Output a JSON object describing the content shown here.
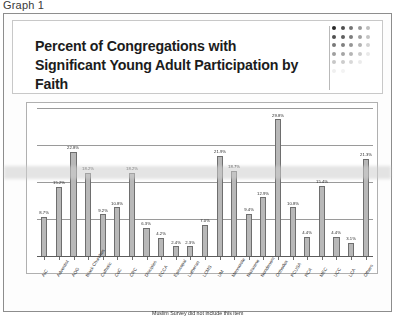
{
  "caption": "Graph 1",
  "title": "Percent of Congregations with Significant Young Adult Participation by Faith",
  "footnote": "Muslim Survey did not include this item",
  "colors": {
    "bar_fill": "#b8b8b8",
    "bar_stroke": "#6e6e6e",
    "grid": "#9a9a9a",
    "frame": "#8d8d8d",
    "text": "#1c1c1c"
  },
  "logo": {
    "name": "gradient-dot-grid-logo",
    "rows": 7,
    "cols": 5
  },
  "chart_data": {
    "type": "bar",
    "title": "Percent of Congregations with Significant Young Adult Participation by Faith",
    "xlabel": "",
    "ylabel": "",
    "ylim": [
      0,
      32
    ],
    "grid": true,
    "gridlines": [
      8,
      16,
      24,
      32
    ],
    "legend": null,
    "categories": [
      "AIC",
      "Adventist",
      "AOG",
      "Black Churches",
      "Catholic",
      "CoC",
      "CRC",
      "Disciples",
      "ECCA",
      "Episcopal",
      "Lutheran",
      "LCMS",
      "UM",
      "Mennonite",
      "Nazarene",
      "Nondenom",
      "Orthodox",
      "PCUSA",
      "RCA",
      "MEC",
      "UCC",
      "LCA",
      "Others"
    ],
    "values": [
      8.7,
      15.2,
      22.8,
      18.2,
      9.2,
      10.8,
      18.2,
      6.3,
      4.2,
      2.4,
      2.3,
      7.0,
      21.9,
      18.7,
      9.4,
      12.9,
      29.8,
      10.8,
      4.4,
      15.4,
      4.4,
      3.1,
      21.3
    ],
    "value_labels": [
      "8.7%",
      "15.2%",
      "22.8%",
      "18.2%",
      "9.2%",
      "10.8%",
      "18.2%",
      "6.3%",
      "4.2%",
      "2.4%",
      "2.3%",
      "7.0%",
      "21.9%",
      "18.7%",
      "9.4%",
      "12.9%",
      "29.8%",
      "10.8%",
      "4.4%",
      "15.4%",
      "4.4%",
      "3.1%",
      "21.3%"
    ]
  }
}
